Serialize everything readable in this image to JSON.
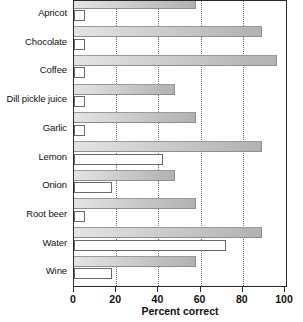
{
  "chart_data": {
    "type": "bar",
    "orientation": "horizontal",
    "title": "",
    "subtitle": "",
    "xlabel": "Percent correct",
    "ylabel": "",
    "xlim": [
      0,
      100
    ],
    "xticks": [
      0,
      20,
      40,
      60,
      80,
      100
    ],
    "grid": "vertical dotted gridlines at 20, 40, 60, 80",
    "legend": "none",
    "categories": [
      "Apricot",
      "Chocolate",
      "Coffee",
      "Dill pickle juice",
      "Garlic",
      "Lemon",
      "Onion",
      "Root beer",
      "Water",
      "Wine"
    ],
    "series": [
      {
        "name": "shaded",
        "style": "shaded-gradient",
        "values": [
          58,
          89,
          96,
          48,
          58,
          89,
          48,
          58,
          89,
          58
        ]
      },
      {
        "name": "open",
        "style": "white-outlined",
        "values": [
          5,
          5,
          5,
          5,
          5,
          42,
          18,
          5,
          72,
          18
        ]
      }
    ]
  },
  "axis": {
    "tick_labels": [
      "0",
      "20",
      "40",
      "60",
      "80",
      "100"
    ],
    "x_label": "Percent correct"
  }
}
